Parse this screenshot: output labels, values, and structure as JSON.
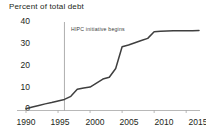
{
  "chart_data": {
    "type": "line",
    "title": "Percent of total debt",
    "xlabel": "",
    "ylabel": "",
    "ylim": [
      0,
      40
    ],
    "xlim": [
      1990,
      2017
    ],
    "yticks": [
      0,
      10,
      20,
      30,
      40
    ],
    "ytick_labels": [
      "0",
      "10",
      "20",
      "30",
      "40"
    ],
    "xticks": [
      1990,
      1995,
      2000,
      2005,
      2010,
      2015
    ],
    "xtick_labels": [
      "1990",
      "1995",
      "2000",
      "2005",
      "2010",
      "2015"
    ],
    "grid": false,
    "legend": false,
    "line_color": "#3f3f3f",
    "annotations": [
      {
        "text": "HIPC initiative begins",
        "type": "vline-label",
        "x": 1996,
        "label_y": 37
      }
    ],
    "series": [
      {
        "name": "Percent of total debt",
        "x": [
          1990,
          1991,
          1992,
          1993,
          1994,
          1995,
          1996,
          1997,
          1998,
          1999,
          2000,
          2001,
          2002,
          2003,
          2004,
          2005,
          2006,
          2007,
          2008,
          2009,
          2010,
          2011,
          2012,
          2013,
          2014,
          2015,
          2016,
          2017
        ],
        "values": [
          0.8,
          1.6,
          2.3,
          3.0,
          3.6,
          4.3,
          5.0,
          6.4,
          9.6,
          10.2,
          10.6,
          12.4,
          14.2,
          15.0,
          19.0,
          28.8,
          29.6,
          30.6,
          31.6,
          32.6,
          35.6,
          35.8,
          35.9,
          36.0,
          36.0,
          36.1,
          36.1,
          36.2
        ]
      }
    ]
  }
}
